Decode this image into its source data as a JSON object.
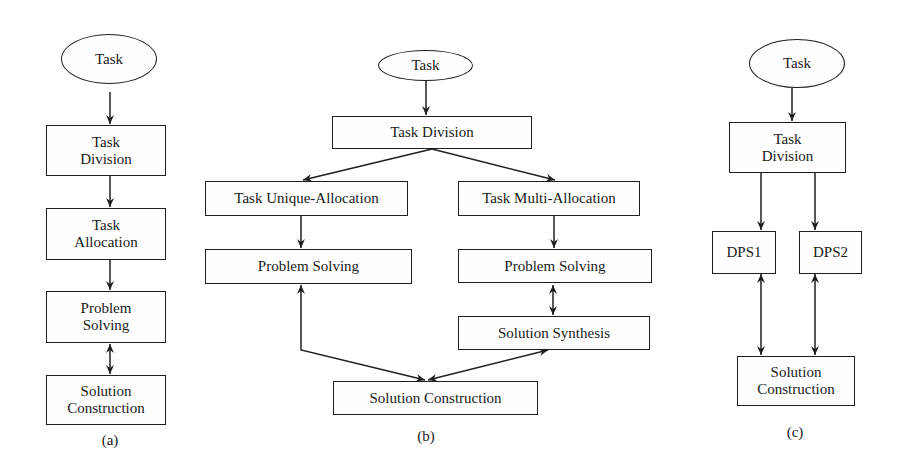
{
  "diagram_a": {
    "label": "(a)",
    "nodes": {
      "task": "Task",
      "task_division": "Task\nDivision",
      "task_allocation": "Task\nAllocation",
      "problem_solving": "Problem\nSolving",
      "solution_construction": "Solution\nConstruction"
    }
  },
  "diagram_b": {
    "label": "(b)",
    "nodes": {
      "task": "Task",
      "task_division": "Task Division",
      "task_unique_allocation": "Task Unique-Allocation",
      "task_multi_allocation": "Task Multi-Allocation",
      "problem_solving_left": "Problem Solving",
      "problem_solving_right": "Problem Solving",
      "solution_synthesis": "Solution Synthesis",
      "solution_construction": "Solution Construction"
    }
  },
  "diagram_c": {
    "label": "(c)",
    "nodes": {
      "task": "Task",
      "task_division": "Task\nDivision",
      "dps1": "DPS1",
      "dps2": "DPS2",
      "solution_construction": "Solution\nConstruction"
    }
  },
  "colors": {
    "stroke": "#1f1f1f",
    "background": "#ffffff"
  }
}
